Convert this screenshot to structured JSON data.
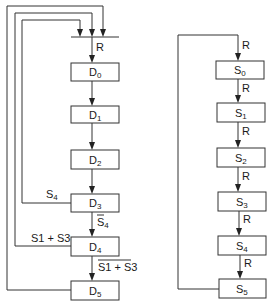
{
  "diagram": {
    "d_chain": {
      "states": [
        {
          "name": "D",
          "sub": "0"
        },
        {
          "name": "D",
          "sub": "1"
        },
        {
          "name": "D",
          "sub": "2"
        },
        {
          "name": "D",
          "sub": "3"
        },
        {
          "name": "D",
          "sub": "4"
        },
        {
          "name": "D",
          "sub": "5"
        }
      ],
      "entry_label": "R",
      "transitions": {
        "d3_to_d4": {
          "text": "S",
          "sub": "4",
          "overline": true
        },
        "d4_to_d5": {
          "text": "S1 + S3",
          "overline": true
        }
      },
      "feedback": {
        "from_d3": {
          "text": "S",
          "sub": "4"
        },
        "from_d4": {
          "text": "S1 + S3"
        },
        "from_d5": {
          "text": ""
        }
      }
    },
    "s_chain": {
      "states": [
        {
          "name": "S",
          "sub": "0"
        },
        {
          "name": "S",
          "sub": "1"
        },
        {
          "name": "S",
          "sub": "2"
        },
        {
          "name": "S",
          "sub": "3"
        },
        {
          "name": "S",
          "sub": "4"
        },
        {
          "name": "S",
          "sub": "5"
        }
      ],
      "transition_label": "R"
    }
  }
}
